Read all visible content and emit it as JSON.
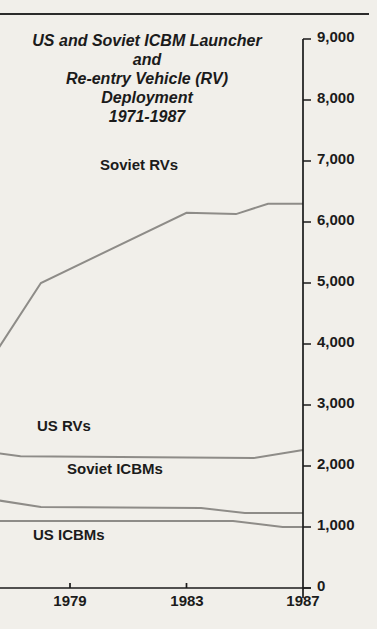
{
  "page": {
    "background": "#f1efea",
    "text_color": "#1b1b1b",
    "rule_color": "#2b2b2b",
    "line_color": "#8e8c88",
    "axis_color": "#1b1b1b"
  },
  "title": {
    "line1": "US and Soviet ICBM Launcher and",
    "line2": "Re-entry Vehicle (RV) Deployment",
    "line3": "1971-1987"
  },
  "chart_data": {
    "type": "line",
    "title": "US and Soviet ICBM Launcher and Re-entry Vehicle (RV) Deployment 1971-1987",
    "grid": false,
    "legend": "inline-labels",
    "x_axis": {
      "label": "",
      "visible_year_range": [
        1976.5,
        1987
      ],
      "ticks": [
        {
          "label": "1979",
          "year": 1979
        },
        {
          "label": "1983",
          "year": 1983
        },
        {
          "label": "1987",
          "year": 1987
        }
      ]
    },
    "y_axis": {
      "label": "",
      "range": [
        0,
        9000
      ],
      "tick_interval": 1000,
      "ticks": [
        {
          "label": "9,000",
          "value": 9000
        },
        {
          "label": "8,000",
          "value": 8000
        },
        {
          "label": "7,000",
          "value": 7000
        },
        {
          "label": "6,000",
          "value": 6000
        },
        {
          "label": "5,000",
          "value": 5000
        },
        {
          "label": "4,000",
          "value": 4000
        },
        {
          "label": "3,000",
          "value": 3000
        },
        {
          "label": "2,000",
          "value": 2000
        },
        {
          "label": "1,000",
          "value": 1000
        },
        {
          "label": "0",
          "value": 0
        }
      ]
    },
    "series": [
      {
        "name": "Soviet RVs",
        "points": [
          [
            1976.5,
            3900
          ],
          [
            1978,
            5000
          ],
          [
            1983,
            6150
          ],
          [
            1984.7,
            6130
          ],
          [
            1985.8,
            6300
          ],
          [
            1987,
            6300
          ]
        ]
      },
      {
        "name": "US RVs",
        "points": [
          [
            1976.5,
            2210
          ],
          [
            1977.3,
            2160
          ],
          [
            1985.3,
            2130
          ],
          [
            1987,
            2260
          ]
        ]
      },
      {
        "name": "Soviet ICBMs",
        "points": [
          [
            1976.5,
            1440
          ],
          [
            1978,
            1330
          ],
          [
            1983.5,
            1310
          ],
          [
            1985,
            1230
          ],
          [
            1987,
            1230
          ]
        ]
      },
      {
        "name": "US ICBMs",
        "points": [
          [
            1976.5,
            1100
          ],
          [
            1984.6,
            1100
          ],
          [
            1986.3,
            1000
          ],
          [
            1987,
            1000
          ]
        ]
      }
    ]
  }
}
